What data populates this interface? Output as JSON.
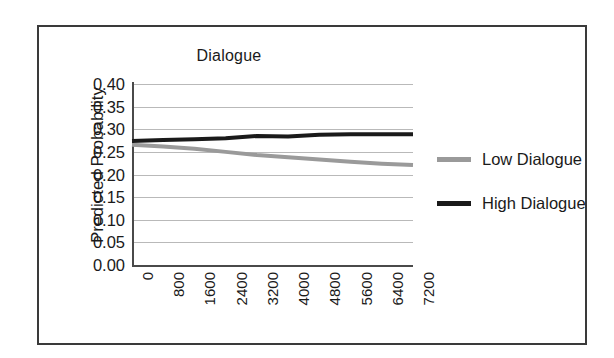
{
  "figure": {
    "border_color": "#3a3a3a",
    "background": "#ffffff"
  },
  "chart_data": {
    "type": "line",
    "title": "Dialogue",
    "xlabel": "",
    "ylabel": "Predicted Probability",
    "x": [
      0,
      800,
      1600,
      2400,
      3200,
      4000,
      4800,
      5600,
      6400,
      7200
    ],
    "categories": [
      "0",
      "800",
      "1600",
      "2400",
      "3200",
      "4000",
      "4800",
      "5600",
      "6400",
      "7200"
    ],
    "ylim": [
      0.0,
      0.4
    ],
    "yticks": [
      0.0,
      0.05,
      0.1,
      0.15,
      0.2,
      0.25,
      0.3,
      0.35,
      0.4
    ],
    "ytick_labels": [
      "0.00",
      "0.05",
      "0.10",
      "0.15",
      "0.20",
      "0.25",
      "0.30",
      "0.35",
      "0.40"
    ],
    "grid": true,
    "grid_axis": "y",
    "legend_position": "right",
    "series": [
      {
        "name": "Low Dialogue",
        "color": "#9a9a9a",
        "values": [
          0.266,
          0.262,
          0.257,
          0.25,
          0.243,
          0.238,
          0.233,
          0.228,
          0.224,
          0.221
        ]
      },
      {
        "name": "High Dialogue",
        "color": "#1a1a1a",
        "values": [
          0.274,
          0.276,
          0.278,
          0.28,
          0.285,
          0.284,
          0.288,
          0.289,
          0.289,
          0.289
        ]
      }
    ]
  },
  "legend": {
    "items": [
      {
        "label": "Low Dialogue",
        "color": "#9a9a9a"
      },
      {
        "label": "High Dialogue",
        "color": "#1a1a1a"
      }
    ]
  }
}
